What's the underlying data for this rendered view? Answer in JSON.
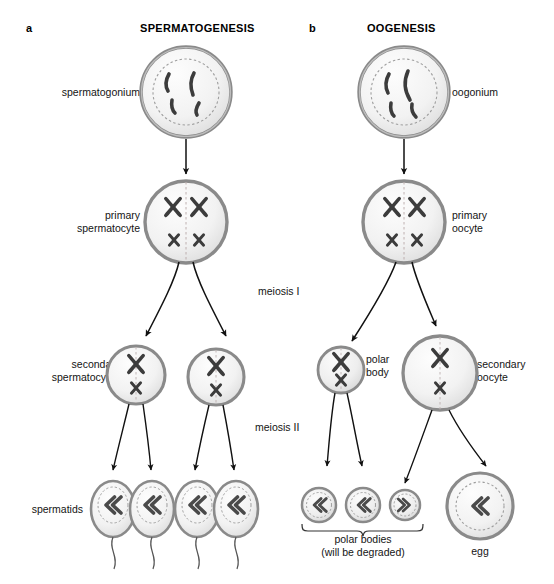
{
  "figure": {
    "panels": [
      {
        "letter": "a",
        "title": "SPERMATOGENESIS"
      },
      {
        "letter": "b",
        "title": "OOGENESIS"
      }
    ],
    "stage_labels": [
      {
        "key": "meiosis_1",
        "text": "meiosis I"
      },
      {
        "key": "meiosis_2",
        "text": "meiosis II"
      }
    ],
    "spermatogenesis": {
      "spermatogonium": "spermatogonium",
      "primary_spermatocyte": "primary\nspermatocyte",
      "secondary_spermatocytes": "secondary\nspermatocytes",
      "spermatids": "spermatids"
    },
    "oogenesis": {
      "oogonium": "oogonium",
      "primary_oocyte": "primary\noocyte",
      "polar_body": "polar\nbody",
      "secondary_oocyte": "secondary\noocyte",
      "polar_bodies": "polar bodies\n(will be degraded)",
      "egg": "egg"
    },
    "colors": {
      "membrane": "#8a8a8a",
      "cytoplasm": "#f2f2f2",
      "nucleus_dash": "#9a9a9a",
      "chromosome": "#3a3a3a",
      "arrow": "#111111",
      "text": "#141414"
    },
    "counts": {
      "spermatogonium_chromosomes": 4,
      "primary_spermatocyte_chromosomes": 4,
      "secondary_spermatocyte_chromosomes": 2,
      "spermatids": 4,
      "polar_bodies": 3,
      "eggs": 1
    }
  }
}
